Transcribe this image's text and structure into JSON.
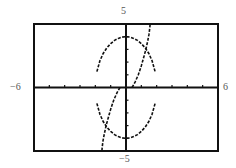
{
  "chart_data": {
    "type": "line",
    "title": "",
    "xlabel": "",
    "ylabel": "",
    "xlim": [
      -6,
      6
    ],
    "ylim": [
      -5,
      5
    ],
    "grid": false,
    "x_tick_step": 1,
    "y_tick_step": 1,
    "tick_labels": {
      "xmin": "−6",
      "xmax": "6",
      "ymin": "−5",
      "ymax": "5"
    },
    "series": [
      {
        "name": "ellipse-upper",
        "style": "dotted",
        "x": [
          -1.9,
          -1.7,
          -1.5,
          -1.25,
          -1.0,
          -0.75,
          -0.5,
          -0.25,
          0.0,
          0.25,
          0.5,
          0.75,
          1.0,
          1.25,
          1.5,
          1.7,
          1.9
        ],
        "y": [
          1.25,
          2.1,
          2.65,
          3.12,
          3.46,
          3.71,
          3.87,
          3.97,
          4.0,
          3.97,
          3.87,
          3.71,
          3.46,
          3.12,
          2.65,
          2.1,
          1.25
        ]
      },
      {
        "name": "ellipse-lower",
        "style": "dotted",
        "x": [
          -1.9,
          -1.7,
          -1.5,
          -1.25,
          -1.0,
          -0.75,
          -0.5,
          -0.25,
          0.0,
          0.25,
          0.5,
          0.75,
          1.0,
          1.25,
          1.5,
          1.7,
          1.9
        ],
        "y": [
          -1.25,
          -2.1,
          -2.65,
          -3.12,
          -3.46,
          -3.71,
          -3.87,
          -3.97,
          -4.0,
          -3.97,
          -3.87,
          -3.71,
          -3.46,
          -3.12,
          -2.65,
          -2.1,
          -1.25
        ]
      },
      {
        "name": "curve-upper-branch",
        "style": "dotted",
        "x": [
          0.4,
          0.6,
          0.8,
          1.0,
          1.15,
          1.3,
          1.42,
          1.5,
          1.55,
          1.57
        ],
        "y": [
          0.0,
          0.45,
          1.0,
          1.7,
          2.35,
          3.0,
          3.7,
          4.2,
          4.7,
          5.0
        ]
      },
      {
        "name": "curve-lower-branch",
        "style": "dotted",
        "x": [
          -0.4,
          -0.6,
          -0.8,
          -1.0,
          -1.15,
          -1.3,
          -1.42,
          -1.5,
          -1.55,
          -1.57
        ],
        "y": [
          0.0,
          -0.45,
          -1.0,
          -1.7,
          -2.35,
          -3.0,
          -3.7,
          -4.2,
          -4.7,
          -5.0
        ]
      }
    ]
  },
  "screen": {
    "frame": {
      "left": 34,
      "top": 24,
      "right": 218,
      "bottom": 151
    },
    "axis_color": "#111111",
    "curve_color": "#111111",
    "label_color": "#555555"
  }
}
